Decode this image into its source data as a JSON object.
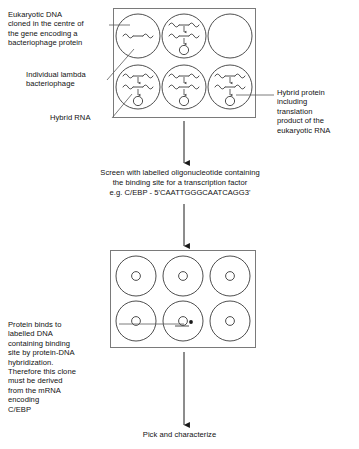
{
  "labels": {
    "eukaryotic_dna": "Eukaryotic DNA\ncloned in the centre of\nthe gene encoding a\nbacteriophage protein",
    "lambda_phage": "Individual lambda\nbacteriophage",
    "hybrid_rna": "Hybrid RNA",
    "hybrid_protein": "Hybrid protein\nincluding\ntranslation\nproduct of the\neukaryotic RNA",
    "screen_step": "Screen with labelled oligonucleotide containing\nthe binding site for a transcription factor\ne.g. C/EBP - 5'CAATTGGGCAATCAGG3'",
    "protein_binds": "Protein binds to\nlabelled DNA\ncontaining binding\nsite by protein-DNA\nhybridization.\nTherefore this clone\nmust be derived\nfrom the mRNA\nencoding\nC/EBP",
    "pick_and_characterize": "Pick and characterize"
  },
  "probe": {
    "transcription_factor": "C/EBP",
    "oligonucleotide_sequence": "5'CAATTGGGCAATCAGG3'"
  },
  "top_panel": {
    "name": "plaque-plate",
    "rows": 2,
    "columns": 3,
    "plaques": [
      {
        "id": "plaque-1",
        "contents": [
          "dna"
        ]
      },
      {
        "id": "plaque-2",
        "contents": [
          "dna",
          "rna",
          "protein"
        ]
      },
      {
        "id": "plaque-3",
        "contents": []
      },
      {
        "id": "plaque-4",
        "contents": [
          "dna",
          "rna",
          "protein"
        ]
      },
      {
        "id": "plaque-5",
        "contents": [
          "dna",
          "rna",
          "protein"
        ]
      },
      {
        "id": "plaque-6",
        "contents": [
          "dna",
          "rna",
          "protein"
        ]
      }
    ]
  },
  "bottom_panel": {
    "name": "filter-membrane",
    "rows": 2,
    "columns": 3,
    "spots": [
      {
        "id": "spot-1",
        "signal": false
      },
      {
        "id": "spot-2",
        "signal": false
      },
      {
        "id": "spot-3",
        "signal": false
      },
      {
        "id": "spot-4",
        "signal": false
      },
      {
        "id": "spot-5",
        "signal": true
      },
      {
        "id": "spot-6",
        "signal": false
      }
    ]
  },
  "colors": {
    "ink": "#111111",
    "panel_border": "#7a7a7a",
    "circle_stroke": "#3a3a3a",
    "leader_line": "#5a5a5a",
    "background": "#ffffff"
  }
}
